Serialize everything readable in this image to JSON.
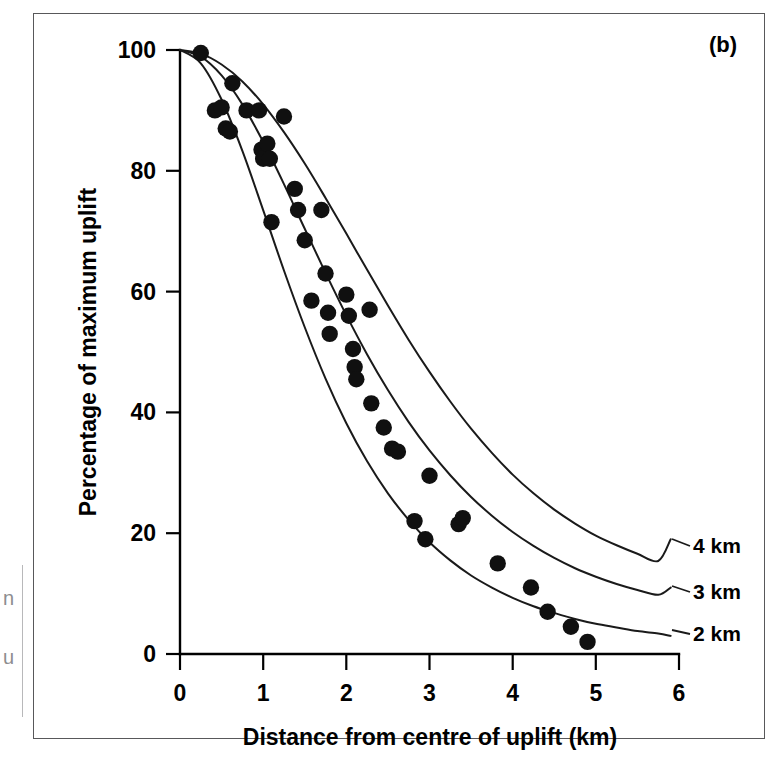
{
  "figure": {
    "panel_label": "(b)",
    "background_color": "#ffffff",
    "frame_color": "#58585a",
    "ink_color": "#101010"
  },
  "chart_data": {
    "type": "scatter",
    "title": "",
    "subtitle": "",
    "xlabel": "Distance from centre of uplift (km)",
    "ylabel": "Percentage of maximum uplift",
    "xlim": [
      0,
      6
    ],
    "ylim": [
      0,
      100
    ],
    "xticks": [
      0,
      1,
      2,
      3,
      4,
      5,
      6
    ],
    "xtick_labels": [
      "0",
      "1",
      "2",
      "3",
      "4",
      "5",
      "6"
    ],
    "yticks": [
      0,
      20,
      40,
      60,
      80,
      100
    ],
    "ytick_labels": [
      "0",
      "20",
      "40",
      "60",
      "80",
      "100"
    ],
    "grid": false,
    "legend_position": "right-inline-curve-labels",
    "annotations": [
      "(b)"
    ],
    "scatter": {
      "name": "Measured uplift",
      "marker": "filled-circle",
      "color": "#101010",
      "points": [
        [
          0.25,
          99.5
        ],
        [
          0.42,
          90.0
        ],
        [
          0.5,
          90.5
        ],
        [
          0.55,
          87.0
        ],
        [
          0.6,
          86.5
        ],
        [
          0.63,
          94.5
        ],
        [
          0.8,
          90.0
        ],
        [
          0.95,
          90.0
        ],
        [
          0.98,
          83.5
        ],
        [
          1.0,
          82.0
        ],
        [
          1.05,
          84.5
        ],
        [
          1.08,
          82.0
        ],
        [
          1.1,
          71.5
        ],
        [
          1.25,
          89.0
        ],
        [
          1.38,
          77.0
        ],
        [
          1.42,
          73.5
        ],
        [
          1.5,
          68.5
        ],
        [
          1.58,
          58.5
        ],
        [
          1.7,
          73.5
        ],
        [
          1.75,
          63.0
        ],
        [
          1.78,
          56.5
        ],
        [
          1.8,
          53.0
        ],
        [
          2.0,
          59.5
        ],
        [
          2.03,
          56.0
        ],
        [
          2.08,
          50.5
        ],
        [
          2.1,
          47.5
        ],
        [
          2.12,
          45.5
        ],
        [
          2.28,
          57.0
        ],
        [
          2.3,
          41.5
        ],
        [
          2.45,
          37.5
        ],
        [
          2.55,
          34.0
        ],
        [
          2.62,
          33.5
        ],
        [
          2.82,
          22.0
        ],
        [
          2.95,
          19.0
        ],
        [
          3.0,
          29.5
        ],
        [
          3.35,
          21.5
        ],
        [
          3.4,
          22.5
        ],
        [
          3.82,
          15.0
        ],
        [
          4.22,
          11.0
        ],
        [
          4.42,
          7.0
        ],
        [
          4.7,
          4.5
        ],
        [
          4.9,
          2.0
        ]
      ]
    },
    "series": [
      {
        "name": "4 km",
        "label": "4 km",
        "depth_km": 4,
        "x": [
          0.0,
          0.25,
          0.5,
          0.75,
          1.0,
          1.25,
          1.5,
          1.75,
          2.0,
          2.25,
          2.5,
          2.75,
          3.0,
          3.25,
          3.5,
          3.75,
          4.0,
          4.25,
          4.5,
          4.75,
          5.0,
          5.25,
          5.5,
          5.75,
          5.9
        ],
        "values": [
          100,
          99.4,
          97.6,
          94.8,
          91.0,
          86.4,
          81.2,
          75.5,
          69.6,
          63.6,
          57.7,
          52.0,
          46.7,
          41.8,
          37.3,
          33.3,
          29.7,
          26.6,
          23.9,
          21.6,
          19.6,
          18.0,
          16.6,
          15.4,
          19.0
        ]
      },
      {
        "name": "3 km",
        "label": "3 km",
        "depth_km": 3,
        "x": [
          0.0,
          0.25,
          0.5,
          0.75,
          1.0,
          1.25,
          1.5,
          1.75,
          2.0,
          2.25,
          2.5,
          2.75,
          3.0,
          3.25,
          3.5,
          3.75,
          4.0,
          4.25,
          4.5,
          4.75,
          5.0,
          5.25,
          5.5,
          5.75,
          5.9
        ],
        "values": [
          100,
          98.9,
          95.8,
          91.0,
          84.8,
          77.8,
          70.4,
          63.1,
          56.1,
          49.6,
          43.7,
          38.4,
          33.7,
          29.6,
          26.0,
          22.9,
          20.2,
          17.9,
          15.9,
          14.2,
          12.8,
          11.6,
          10.6,
          9.8,
          11.0
        ]
      },
      {
        "name": "2 km",
        "label": "2 km",
        "depth_km": 2,
        "x": [
          0.0,
          0.25,
          0.5,
          0.75,
          1.0,
          1.25,
          1.5,
          1.75,
          2.0,
          2.25,
          2.5,
          2.75,
          3.0,
          3.25,
          3.5,
          3.75,
          4.0,
          4.25,
          4.5,
          4.75,
          5.0,
          5.25,
          5.5,
          5.75,
          5.9
        ],
        "values": [
          100,
          97.8,
          91.8,
          83.3,
          73.5,
          63.5,
          54.1,
          45.6,
          38.2,
          31.9,
          26.6,
          22.2,
          18.5,
          15.5,
          13.0,
          11.0,
          9.3,
          7.9,
          6.8,
          5.8,
          5.0,
          4.4,
          3.8,
          3.4,
          3.0
        ]
      }
    ]
  }
}
